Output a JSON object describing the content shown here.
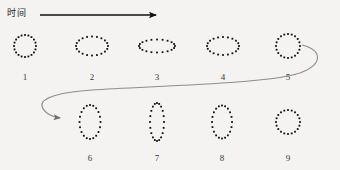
{
  "figure": {
    "background_color": "#f4f3f1",
    "width": 340,
    "height": 170
  },
  "time_axis": {
    "label": "时间",
    "arrow_name": "time-arrow",
    "color": "#121212",
    "x_start": 40,
    "x_end": 160,
    "y": 15
  },
  "flow_arrow": {
    "name": "wrap-around-arrow",
    "color": "#8d8d8d",
    "description": "S-curve from right of shape 5 wrapping down and left to shape 6"
  },
  "shapes": {
    "dot_color": "#111111",
    "dot_count": 20,
    "items": [
      {
        "label": "1",
        "cx": 25,
        "cy": 46,
        "rx": 11,
        "ry": 11,
        "row": "top"
      },
      {
        "label": "2",
        "cx": 92,
        "cy": 46,
        "rx": 16,
        "ry": 9.5,
        "row": "top"
      },
      {
        "label": "3",
        "cx": 157,
        "cy": 46,
        "rx": 18,
        "ry": 6.5,
        "row": "top"
      },
      {
        "label": "4",
        "cx": 223,
        "cy": 46,
        "rx": 16,
        "ry": 9,
        "row": "top"
      },
      {
        "label": "5",
        "cx": 288,
        "cy": 46,
        "rx": 12,
        "ry": 12,
        "row": "top"
      },
      {
        "label": "6",
        "cx": 90,
        "cy": 122,
        "rx": 10.5,
        "ry": 17,
        "row": "bottom"
      },
      {
        "label": "7",
        "cx": 157,
        "cy": 122,
        "rx": 7,
        "ry": 19,
        "row": "bottom"
      },
      {
        "label": "8",
        "cx": 222,
        "cy": 122,
        "rx": 10,
        "ry": 16.5,
        "row": "bottom"
      },
      {
        "label": "9",
        "cx": 288,
        "cy": 122,
        "rx": 12,
        "ry": 12,
        "row": "bottom"
      }
    ],
    "label_offset_top": 72,
    "label_offset_bottom": 153
  },
  "chart_data": {
    "type": "diagram",
    "title": "时间",
    "categories": [
      "1",
      "2",
      "3",
      "4",
      "5",
      "6",
      "7",
      "8",
      "9"
    ],
    "series": [
      {
        "name": "semi-axis-x",
        "values": [
          11,
          16,
          18,
          16,
          12,
          10.5,
          7,
          10,
          12
        ]
      },
      {
        "name": "semi-axis-y",
        "values": [
          11,
          9.5,
          6.5,
          9,
          12,
          17,
          19,
          16.5,
          12
        ]
      },
      {
        "name": "aspect-ratio-x-over-y",
        "values": [
          1.0,
          1.68,
          2.77,
          1.78,
          1.0,
          0.62,
          0.37,
          0.61,
          1.0
        ]
      }
    ],
    "xlabel": "时间",
    "ylabel": "",
    "grid": false,
    "legend": "none"
  }
}
